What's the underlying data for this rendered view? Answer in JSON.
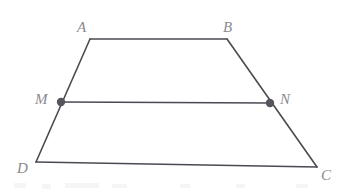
{
  "figure": {
    "name": "trapezoid-midsegment-diagram",
    "background_color": "#ffffff",
    "stroke_color": "#4a4a52",
    "label_color": "#8a8a8f",
    "point_fill_color": "#55555d",
    "stroke_width": 1.6,
    "point_radius": 4.2,
    "width": 350,
    "height": 194
  },
  "vertices": [
    {
      "id": "A",
      "label": "A",
      "x": 90,
      "y": 39,
      "label_x": 77,
      "label_y": 20
    },
    {
      "id": "B",
      "label": "B",
      "x": 227,
      "y": 39,
      "label_x": 223,
      "label_y": 20
    },
    {
      "id": "C",
      "label": "C",
      "x": 317,
      "y": 167,
      "label_x": 321,
      "label_y": 168
    },
    {
      "id": "D",
      "label": "D",
      "x": 36,
      "y": 162,
      "label_x": 17,
      "label_y": 161
    }
  ],
  "points": [
    {
      "id": "M",
      "label": "M",
      "x": 61,
      "y": 102,
      "label_x": 35,
      "label_y": 92
    },
    {
      "id": "N",
      "label": "N",
      "x": 270,
      "y": 103,
      "label_x": 280,
      "label_y": 92
    }
  ],
  "segments": [
    {
      "id": "AB",
      "from": "A",
      "to": "B",
      "x1": 90,
      "y1": 39,
      "x2": 227,
      "y2": 39
    },
    {
      "id": "BC",
      "from": "B",
      "to": "C",
      "x1": 227,
      "y1": 39,
      "x2": 317,
      "y2": 167
    },
    {
      "id": "CD",
      "from": "C",
      "to": "D",
      "x1": 317,
      "y1": 167,
      "x2": 36,
      "y2": 162
    },
    {
      "id": "DA",
      "from": "D",
      "to": "A",
      "x1": 36,
      "y1": 162,
      "x2": 90,
      "y2": 39
    },
    {
      "id": "MN",
      "from": "M",
      "to": "N",
      "x1": 61,
      "y1": 102,
      "x2": 270,
      "y2": 103
    }
  ],
  "artifacts": [
    {
      "id": "artifact-1",
      "x": 14,
      "y": 183,
      "w": 12,
      "h": 5
    },
    {
      "id": "artifact-2",
      "x": 42,
      "y": 184,
      "w": 9,
      "h": 5
    },
    {
      "id": "artifact-3",
      "x": 65,
      "y": 183,
      "w": 34,
      "h": 5
    },
    {
      "id": "artifact-4",
      "x": 112,
      "y": 184,
      "w": 15,
      "h": 4
    },
    {
      "id": "artifact-5",
      "x": 180,
      "y": 184,
      "w": 10,
      "h": 4
    },
    {
      "id": "artifact-6",
      "x": 236,
      "y": 184,
      "w": 9,
      "h": 4
    },
    {
      "id": "artifact-7",
      "x": 296,
      "y": 184,
      "w": 12,
      "h": 4
    }
  ]
}
